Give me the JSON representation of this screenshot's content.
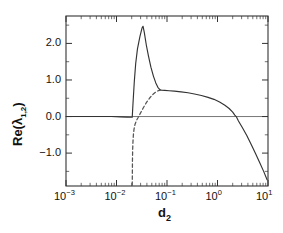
{
  "chart_data": {
    "type": "line",
    "title": "",
    "xlabel": "d_2",
    "xlabel_base": "d",
    "xlabel_sub": "2",
    "ylabel": "Re(λ_{1,2})",
    "ylabel_prefix": "Re(λ",
    "ylabel_sub": "1,2",
    "ylabel_suffix": ")",
    "xscale": "log",
    "yscale": "linear",
    "xlim": [
      0.001,
      10
    ],
    "ylim": [
      -1.9,
      2.75
    ],
    "grid": false,
    "legend": null,
    "xticks": [
      0.001,
      0.01,
      0.1,
      1,
      10
    ],
    "xtick_labels": [
      "10−3",
      "10−2",
      "10−1",
      "10⁰",
      "10¹"
    ],
    "xtick_mantissas": [
      "10",
      "10",
      "10",
      "10",
      "10"
    ],
    "xtick_exponents": [
      "-3",
      "-2",
      "-1",
      "0",
      "1"
    ],
    "yticks": [
      -1.0,
      0.0,
      1.0,
      2.0
    ],
    "ytick_labels": [
      "−1.0",
      "0.0",
      "1.0",
      "2.0"
    ],
    "zero_line": 0.0,
    "series": [
      {
        "name": "Re(lambda_1)",
        "style": "solid",
        "color": "#333333",
        "points": [
          [
            0.001,
            0.0
          ],
          [
            0.0035,
            0.0
          ],
          [
            0.008,
            0.0
          ],
          [
            0.012,
            -0.01
          ],
          [
            0.016,
            -0.015
          ],
          [
            0.0198,
            -0.02
          ],
          [
            0.0205,
            -0.02
          ],
          [
            0.0212,
            0.35
          ],
          [
            0.0225,
            0.95
          ],
          [
            0.024,
            1.45
          ],
          [
            0.026,
            1.85
          ],
          [
            0.029,
            2.18
          ],
          [
            0.032,
            2.42
          ],
          [
            0.0335,
            2.47
          ],
          [
            0.0355,
            2.3
          ],
          [
            0.039,
            1.95
          ],
          [
            0.043,
            1.65
          ],
          [
            0.048,
            1.35
          ],
          [
            0.054,
            1.1
          ],
          [
            0.06,
            0.92
          ],
          [
            0.066,
            0.8
          ],
          [
            0.072,
            0.735
          ],
          [
            0.078,
            0.72
          ],
          [
            0.09,
            0.715
          ],
          [
            0.11,
            0.705
          ],
          [
            0.14,
            0.695
          ],
          [
            0.19,
            0.675
          ],
          [
            0.26,
            0.65
          ],
          [
            0.35,
            0.615
          ],
          [
            0.48,
            0.575
          ],
          [
            0.65,
            0.525
          ],
          [
            0.85,
            0.47
          ],
          [
            1.1,
            0.4
          ],
          [
            1.4,
            0.31
          ],
          [
            1.7,
            0.22
          ],
          [
            2.0,
            0.12
          ],
          [
            2.2,
            0.04
          ],
          [
            2.35,
            0.0
          ],
          [
            2.6,
            -0.12
          ],
          [
            3.1,
            -0.3
          ],
          [
            3.8,
            -0.52
          ],
          [
            4.6,
            -0.75
          ],
          [
            5.6,
            -1.0
          ],
          [
            6.8,
            -1.25
          ],
          [
            8.2,
            -1.5
          ],
          [
            9.6,
            -1.73
          ]
        ]
      },
      {
        "name": "Re(lambda_2)",
        "style": "dashed",
        "color": "#555555",
        "points": [
          [
            0.0205,
            -1.88
          ],
          [
            0.0206,
            -1.55
          ],
          [
            0.0207,
            -1.2
          ],
          [
            0.0209,
            -0.9
          ],
          [
            0.0212,
            -0.68
          ],
          [
            0.0216,
            -0.5
          ],
          [
            0.0222,
            -0.35
          ],
          [
            0.0232,
            -0.22
          ],
          [
            0.0248,
            -0.11
          ],
          [
            0.027,
            -0.02
          ],
          [
            0.03,
            0.1
          ],
          [
            0.034,
            0.24
          ],
          [
            0.039,
            0.38
          ],
          [
            0.045,
            0.5
          ],
          [
            0.052,
            0.6
          ],
          [
            0.06,
            0.67
          ],
          [
            0.068,
            0.71
          ],
          [
            0.075,
            0.72
          ]
        ]
      }
    ],
    "annotations": [
      {
        "text": "solid curve shows a sharp spike peaking near d_2 = 0.033 at Re = 2.47"
      },
      {
        "text": "dashed branch emerges vertically at d_2 ≈ 0.0205 and merges with solid branch near d_2 ≈ 0.075"
      }
    ]
  },
  "figure": {
    "background_color": "#ffffff",
    "axis_color": "#333333",
    "frame": {
      "left": 66,
      "right": 268,
      "top": 16,
      "bottom": 186
    }
  }
}
